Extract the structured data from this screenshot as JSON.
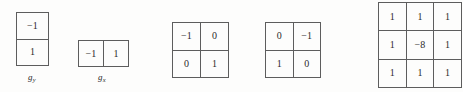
{
  "figure": {
    "background_color": "#fdfdfc",
    "line_color": "#5d5d5d",
    "text_color": "#2b2b2b",
    "kernels": [
      {
        "id": "gy",
        "name": "gradient-kernel-gy",
        "rows": 2,
        "cols": 1,
        "values": [
          [
            "−1"
          ],
          [
            "1"
          ]
        ],
        "label_base": "g",
        "label_sub": "y"
      },
      {
        "id": "gx",
        "name": "gradient-kernel-gx",
        "rows": 1,
        "cols": 2,
        "values": [
          [
            "−1",
            "1"
          ]
        ],
        "label_base": "g",
        "label_sub": "x"
      },
      {
        "id": "roberts1",
        "name": "roberts-kernel-1",
        "rows": 2,
        "cols": 2,
        "values": [
          [
            "−1",
            "0"
          ],
          [
            "0",
            "1"
          ]
        ],
        "label_base": "",
        "label_sub": ""
      },
      {
        "id": "roberts2",
        "name": "roberts-kernel-2",
        "rows": 2,
        "cols": 2,
        "values": [
          [
            "0",
            "−1"
          ],
          [
            "1",
            "0"
          ]
        ],
        "label_base": "",
        "label_sub": ""
      },
      {
        "id": "laplacian",
        "name": "laplacian-kernel",
        "rows": 3,
        "cols": 3,
        "values": [
          [
            "1",
            "1",
            "1"
          ],
          [
            "1",
            "−8",
            "1"
          ],
          [
            "1",
            "1",
            "1"
          ]
        ],
        "label_base": "",
        "label_sub": ""
      }
    ]
  }
}
